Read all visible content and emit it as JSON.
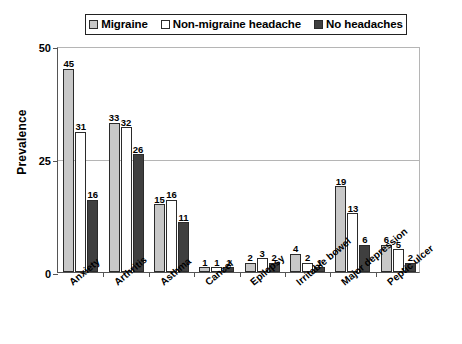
{
  "chart_data": {
    "type": "bar",
    "title": "",
    "subtitle": "",
    "xlabel": "",
    "ylabel": "Prevalence",
    "ylim": [
      0,
      50
    ],
    "yticks": [
      0,
      25,
      50
    ],
    "grid": true,
    "legend_position": "top-center",
    "categories": [
      "Anxiety",
      "Arthritis",
      "Asthma",
      "Cancer",
      "Epilepsy",
      "Irritable bowel",
      "Major depression",
      "Peptic ulcer"
    ],
    "series": [
      {
        "name": "Migraine",
        "color": "#c8c8c8",
        "values": [
          45,
          33,
          15,
          1,
          2,
          4,
          19,
          6
        ]
      },
      {
        "name": "Non-migraine headache",
        "color": "#ffffff",
        "values": [
          31,
          32,
          16,
          1,
          3,
          2,
          13,
          5
        ]
      },
      {
        "name": "No headaches",
        "color": "#3f3f3f",
        "values": [
          16,
          26,
          11,
          1,
          2,
          1,
          6,
          2
        ]
      }
    ]
  },
  "legend": {
    "items": [
      {
        "label": "Migraine",
        "color": "#c8c8c8"
      },
      {
        "label": "Non-migraine headache",
        "color": "#ffffff"
      },
      {
        "label": "No headaches",
        "color": "#3f3f3f"
      }
    ]
  },
  "axis": {
    "y_title": "Prevalence",
    "y_tick_labels": [
      "0",
      "25",
      "50"
    ]
  }
}
